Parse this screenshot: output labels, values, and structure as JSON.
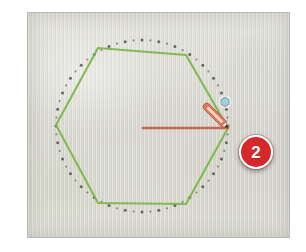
{
  "figure": {
    "kind": "instructional-photo",
    "background_color": "#d8d7d1",
    "frame_color": "#ffffff"
  },
  "annotations": {
    "step_badge": {
      "label": "2",
      "fill_color": "#d6282b",
      "text_color": "#ffffff",
      "ring_color": "#ffffff",
      "center": {
        "x": 256,
        "y": 152
      }
    }
  },
  "drawing": {
    "polygon": {
      "name": "hexagon",
      "stroke_color": "#7ab648",
      "sides": 6,
      "vertices": [
        {
          "x": 28,
          "y": 112
        },
        {
          "x": 70,
          "y": 35
        },
        {
          "x": 158,
          "y": 42
        },
        {
          "x": 200,
          "y": 115
        },
        {
          "x": 158,
          "y": 191
        },
        {
          "x": 70,
          "y": 190
        }
      ]
    },
    "construction_circle": {
      "name": "dotted-circle",
      "stroke_color": "#4a4840",
      "style": "dotted",
      "center": {
        "x": 114,
        "y": 113
      },
      "radius": 86,
      "dot_count": 64
    },
    "radius_line": {
      "name": "radius-line",
      "stroke_color": "#c0604a",
      "from": {
        "x": 115,
        "y": 115
      },
      "to": {
        "x": 200,
        "y": 115
      }
    },
    "snap_marker": {
      "name": "inference-point",
      "shape": "hexagon",
      "fill_color": "#a9cdd8",
      "stroke_color": "#7fa8b4",
      "center": {
        "x": 197,
        "y": 89
      },
      "size": 9
    },
    "cursor": {
      "name": "pencil-cursor",
      "body_color": "#e07a5f",
      "highlight_color": "#f6d8cd",
      "tip_color": "#2b2b2b",
      "tip": {
        "x": 200,
        "y": 115
      },
      "angle_deg": 45
    }
  }
}
